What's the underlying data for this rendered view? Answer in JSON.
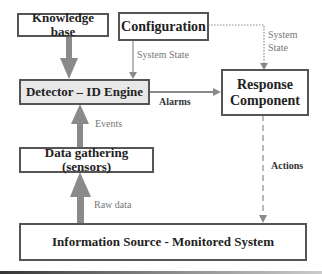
{
  "diagram": {
    "nodes": {
      "knowledge_base": "Knowledge base",
      "configuration": "Configuration",
      "detector": "Detector – ID Engine",
      "response_line1": "Response",
      "response_line2": "Component",
      "data_gathering": "Data gathering (sensors)",
      "information_source": "Information Source - Monitored System"
    },
    "edges": {
      "config_to_detector": "System State",
      "config_to_response_line1": "System",
      "config_to_response_line2": "State",
      "detector_to_response": "Alarms",
      "gathering_to_detector": "Events",
      "source_to_gathering": "Raw data",
      "response_to_source": "Actions"
    },
    "colors": {
      "arrow_gray": "#8a8a8a",
      "box_border": "#555555",
      "detector_fill": "#e8e8e8"
    }
  }
}
